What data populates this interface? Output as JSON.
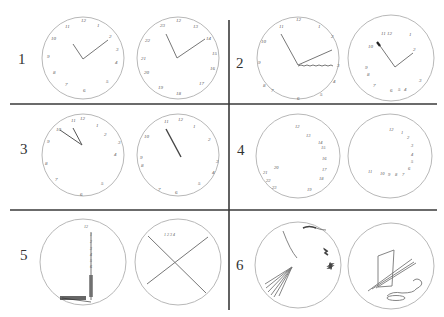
{
  "figure": {
    "panels": [
      {
        "id": 1,
        "label": "1",
        "description": "Two clocks with numbers placed around the face and two hands",
        "left_clock_numbers": [
          "12",
          "1",
          "2",
          "3",
          "4",
          "5",
          "6",
          "7",
          "8",
          "9",
          "10",
          "11"
        ],
        "right_clock_numbers": [
          "12",
          "13",
          "14",
          "15",
          "16",
          "17",
          "18",
          "19",
          "20",
          "21",
          "22",
          "23"
        ]
      },
      {
        "id": 2,
        "label": "2",
        "description": "Clock with perseverative hand; clock with crowded numbers",
        "left_clock_numbers": [
          "12",
          "1",
          "2",
          "3",
          "4",
          "5",
          "6",
          "7",
          "8",
          "9",
          "10",
          "11"
        ],
        "right_clock_numbers": [
          "11",
          "12",
          "1",
          "2",
          "3",
          "4",
          "5",
          "6",
          "7",
          "8",
          "10"
        ]
      },
      {
        "id": 3,
        "label": "3",
        "description": "Clocks with numbers spaced irregularly, hands pointing near 11",
        "left_clock_numbers": [
          "11",
          "12",
          "1",
          "2",
          "3",
          "4",
          "5",
          "6",
          "7",
          "8",
          "9",
          "10"
        ],
        "right_clock_numbers": [
          "11",
          "12",
          "1",
          "2",
          "3",
          "4",
          "5",
          "6",
          "7",
          "8",
          "9",
          "10"
        ]
      },
      {
        "id": 4,
        "label": "4",
        "description": "Numbers clustered on one side, no hands",
        "left_clock_numbers": [
          "12",
          "13",
          "14",
          "15",
          "16",
          "17",
          "18",
          "19",
          "20",
          "21",
          "22"
        ],
        "right_clock_numbers": [
          "12",
          "1",
          "2",
          "3",
          "4",
          "5",
          "6",
          "7",
          "8",
          "9",
          "10",
          "11"
        ]
      },
      {
        "id": 5,
        "label": "5",
        "description": "Numbers in a vertical line; clock divided into quadrants",
        "right_clock_numbers": [
          "1",
          "2",
          "3",
          "4"
        ]
      },
      {
        "id": 6,
        "label": "6",
        "description": "Severely disorganized drawings with scribbles"
      }
    ]
  },
  "colors": {
    "divider": "#3a3a3a",
    "circle": "#b8b8b8",
    "stroke": "#777777",
    "background": "#ffffff"
  }
}
